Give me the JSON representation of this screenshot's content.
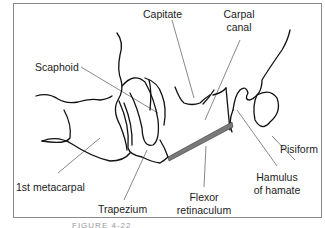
{
  "figure": {
    "caption": "FIGURE 4-22",
    "frame_color": "#8a8a8a",
    "line_color": "#111111",
    "leader_color": "#555555",
    "retinaculum_color": "#7a7a7a"
  },
  "labels": {
    "capitate": "Capitate",
    "carpal_canal_1": "Carpal",
    "carpal_canal_2": "canal",
    "scaphoid": "Scaphoid",
    "pisiform": "Pisiform",
    "first_metacarpal": "1st metacarpal",
    "hamulus_1": "Hamulus",
    "hamulus_2": "of hamate",
    "flexor_1": "Flexor",
    "flexor_2": "retinaculum",
    "trapezium": "Trapezium"
  }
}
